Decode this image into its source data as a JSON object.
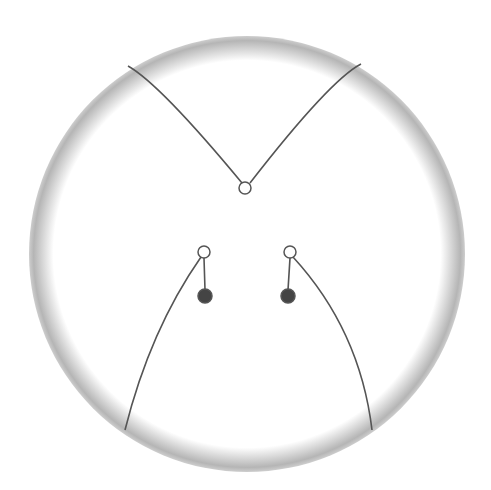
{
  "diagram": {
    "canvas": {
      "width": 491,
      "height": 490,
      "background": "#ffffff"
    },
    "ring": {
      "cx": 247,
      "cy": 254,
      "r": 207,
      "thickness": 22,
      "color": "#bdbdbd"
    },
    "line_color": "#555555",
    "curves": [
      {
        "id": "top-left",
        "from": [
          128,
          66
        ],
        "to": [
          242,
          183
        ]
      },
      {
        "id": "top-right",
        "from": [
          361,
          64
        ],
        "to": [
          250,
          183
        ]
      },
      {
        "id": "bottom-left",
        "from": [
          201,
          257
        ],
        "to": [
          125,
          430
        ]
      },
      {
        "id": "bottom-right",
        "from": [
          292,
          257
        ],
        "to": [
          372,
          430
        ]
      }
    ],
    "nodes": [
      {
        "id": "top-junction",
        "cx": 245,
        "cy": 188,
        "r": 6,
        "filled": false
      },
      {
        "id": "left-open",
        "cx": 204,
        "cy": 252,
        "r": 6,
        "filled": false
      },
      {
        "id": "left-filled",
        "cx": 205,
        "cy": 296,
        "r": 7,
        "filled": true
      },
      {
        "id": "right-open",
        "cx": 290,
        "cy": 252,
        "r": 6,
        "filled": false
      },
      {
        "id": "right-filled",
        "cx": 288,
        "cy": 296,
        "r": 7,
        "filled": true
      }
    ]
  }
}
